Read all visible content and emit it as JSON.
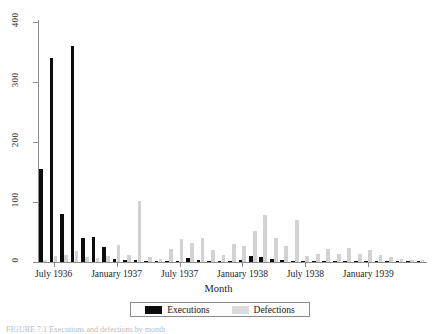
{
  "figure": {
    "axis_title_x": "Month",
    "caption_partial": "FIGURE 7.1  Executions and defections by month",
    "legend": {
      "items": [
        {
          "label": "Executions",
          "color": "#0b0b0b",
          "swatch": "exec"
        },
        {
          "label": "Defections",
          "color": "#dcdcdc",
          "swatch": "defect"
        }
      ]
    }
  },
  "chart_data": {
    "type": "bar",
    "title": "",
    "xlabel": "Month",
    "ylabel": "",
    "ylim": [
      0,
      400
    ],
    "ytick_values": [
      0,
      100,
      200,
      300,
      400
    ],
    "ytick_labels": [
      "0",
      "100",
      "200",
      "300",
      "400"
    ],
    "grid": false,
    "legend_position": "bottom",
    "xtick_labels": [
      "July 1936",
      "January 1937",
      "July 1937",
      "January 1938",
      "July 1938",
      "January 1939"
    ],
    "xtick_months": [
      "1936-07",
      "1937-01",
      "1937-07",
      "1938-01",
      "1938-07",
      "1939-01"
    ],
    "categories": [
      "1936-06",
      "1936-07",
      "1936-08",
      "1936-09",
      "1936-10",
      "1936-11",
      "1936-12",
      "1937-01",
      "1937-02",
      "1937-03",
      "1937-04",
      "1937-05",
      "1937-06",
      "1937-07",
      "1937-08",
      "1937-09",
      "1937-10",
      "1937-11",
      "1937-12",
      "1938-01",
      "1938-02",
      "1938-03",
      "1938-04",
      "1938-05",
      "1938-06",
      "1938-07",
      "1938-08",
      "1938-09",
      "1938-10",
      "1938-11",
      "1938-12",
      "1939-01",
      "1939-02",
      "1939-03",
      "1939-04",
      "1939-05",
      "1939-06"
    ],
    "series": [
      {
        "name": "Executions",
        "color": "#0b0b0b",
        "values": [
          155,
          340,
          80,
          360,
          40,
          42,
          25,
          5,
          4,
          3,
          2,
          1,
          1,
          2,
          6,
          3,
          2,
          1,
          1,
          4,
          10,
          9,
          5,
          3,
          2,
          1,
          1,
          1,
          1,
          1,
          1,
          1,
          1,
          1,
          1,
          1,
          1
        ]
      },
      {
        "name": "Defections",
        "color": "#d2d2d2",
        "values": [
          3,
          10,
          12,
          18,
          8,
          6,
          10,
          28,
          12,
          102,
          8,
          5,
          22,
          38,
          32,
          40,
          20,
          12,
          30,
          26,
          52,
          78,
          40,
          26,
          70,
          10,
          14,
          22,
          13,
          24,
          13,
          20,
          11,
          9,
          5,
          4,
          3
        ]
      }
    ]
  }
}
